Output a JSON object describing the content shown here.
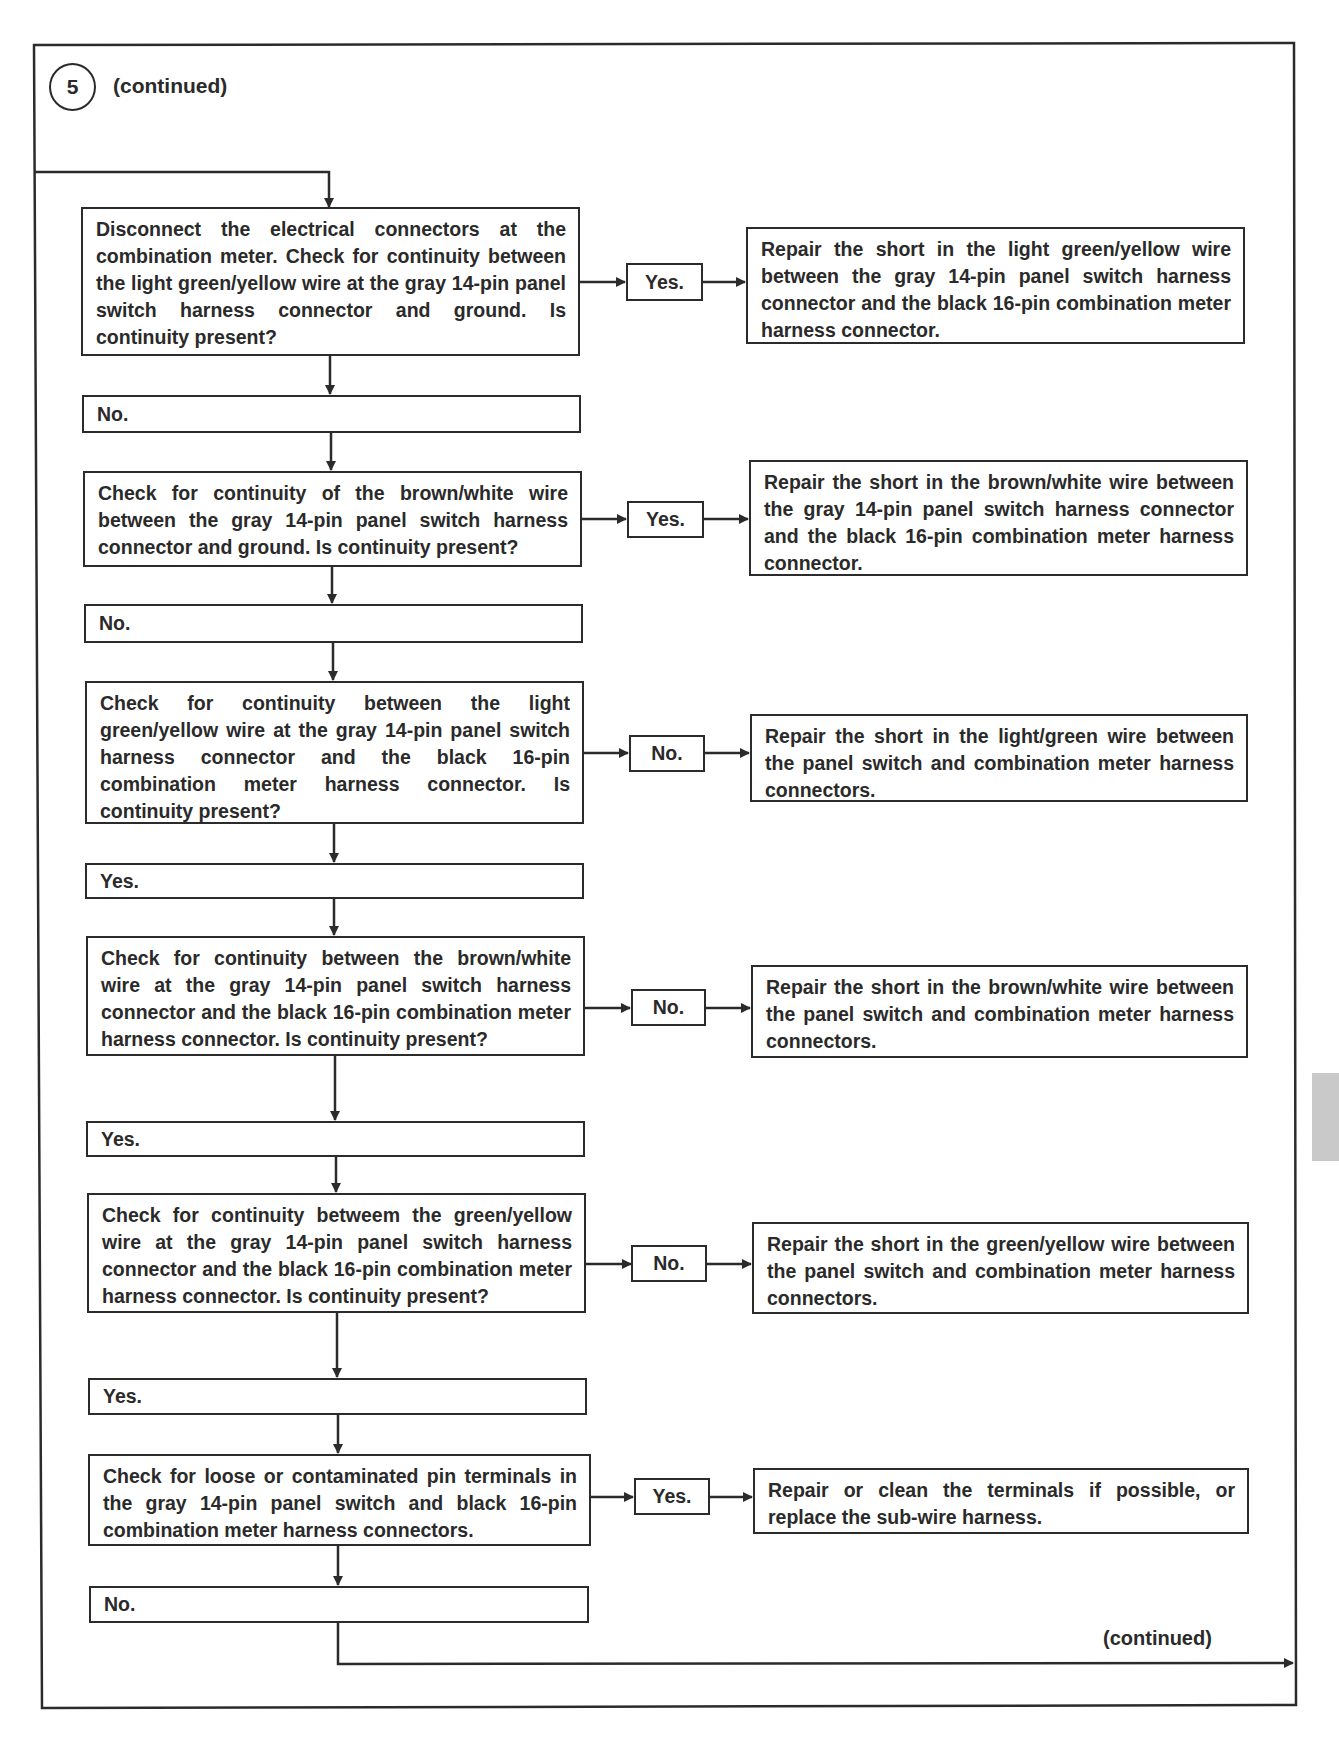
{
  "header": {
    "step_number": "5",
    "step_suffix": "(continued)"
  },
  "footer": {
    "continued_label": "(continued)"
  },
  "flowchart": {
    "steps": [
      {
        "question": "Disconnect the electrical connectors at the combination meter. Check for continuity between the light green/yellow wire at the gray 14-pin panel switch harness connector and ground. Is continuity present?",
        "branch_label": "Yes.",
        "action": "Repair the short in the light green/yellow wire between the gray 14-pin panel switch harness connector and the black 16-pin combination meter harness connector.",
        "continue_label": "No."
      },
      {
        "question": "Check for continuity of the brown/white wire between the gray 14-pin panel switch harness connector and ground. Is continuity present?",
        "branch_label": "Yes.",
        "action": "Repair the short in the brown/white wire between the gray 14-pin panel switch harness connector and the black 16-pin combination meter harness connector.",
        "continue_label": "No."
      },
      {
        "question": "Check for continuity between the light green/yellow wire at the gray 14-pin panel switch harness connector and the black 16-pin combination meter harness connector. Is continuity present?",
        "branch_label": "No.",
        "action": "Repair the short in the light/green wire between the panel switch and combination meter harness connectors.",
        "continue_label": "Yes."
      },
      {
        "question": "Check for continuity between the brown/white wire at the gray 14-pin panel switch harness connector and the black 16-pin combination meter harness connector. Is continuity present?",
        "branch_label": "No.",
        "action": "Repair the short in the brown/white wire between the panel switch and combination meter harness connectors.",
        "continue_label": "Yes."
      },
      {
        "question": "Check for continuity betweem the green/yellow wire at the gray 14-pin panel switch harness connector and the black 16-pin combination meter harness connector. Is continuity present?",
        "branch_label": "No.",
        "action": "Repair the short in the green/yellow wire between the panel switch and combination meter harness connectors.",
        "continue_label": "Yes."
      },
      {
        "question": "Check for loose or contaminated pin terminals in the gray 14-pin panel switch and black 16-pin combination meter harness connectors.",
        "branch_label": "Yes.",
        "action": "Repair or clean the terminals if possible, or replace the sub-wire harness.",
        "continue_label": "No."
      }
    ]
  },
  "colors": {
    "ink": "#2b2b2b",
    "background": "#ffffff",
    "thumb_tab": "#c9c9c9"
  }
}
